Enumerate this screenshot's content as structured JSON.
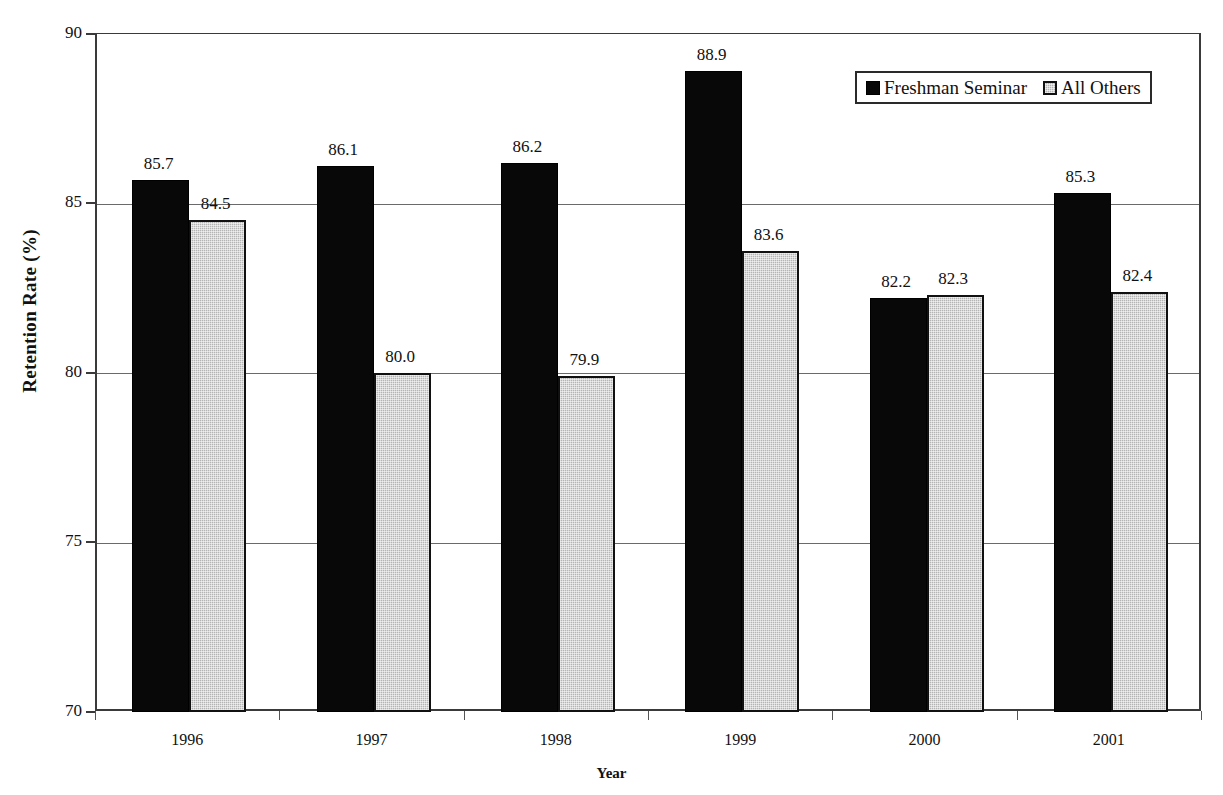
{
  "chart_data": {
    "type": "bar",
    "title": "",
    "xlabel": "Year",
    "ylabel": "Retention Rate (%)",
    "categories": [
      "1996",
      "1997",
      "1998",
      "1999",
      "2000",
      "2001"
    ],
    "series": [
      {
        "name": "Freshman Seminar",
        "color": "#080808",
        "values": [
          85.7,
          86.1,
          86.2,
          88.9,
          82.2,
          85.3
        ]
      },
      {
        "name": "All Others",
        "color": "#b4b4b4",
        "values": [
          84.5,
          80.0,
          79.9,
          83.6,
          82.3,
          82.4
        ]
      }
    ],
    "ylim": [
      70,
      90
    ],
    "yticks": [
      70,
      75,
      80,
      85,
      90
    ],
    "ytick_labels": [
      "70",
      "75",
      "80",
      "85",
      "90"
    ],
    "grid": true,
    "legend_position": "top-right",
    "data_labels": {
      "series_0": [
        "85.7",
        "86.1",
        "86.2",
        "88.9",
        "82.2",
        "85.3"
      ],
      "series_1": [
        "84.5",
        "80.0",
        "79.9",
        "83.6",
        "82.3",
        "82.4"
      ]
    }
  },
  "axes": {
    "y_title": "Retention Rate (%)",
    "x_title": "Year"
  },
  "legend": {
    "items": [
      {
        "label": "Freshman Seminar"
      },
      {
        "label": "All Others"
      }
    ]
  }
}
